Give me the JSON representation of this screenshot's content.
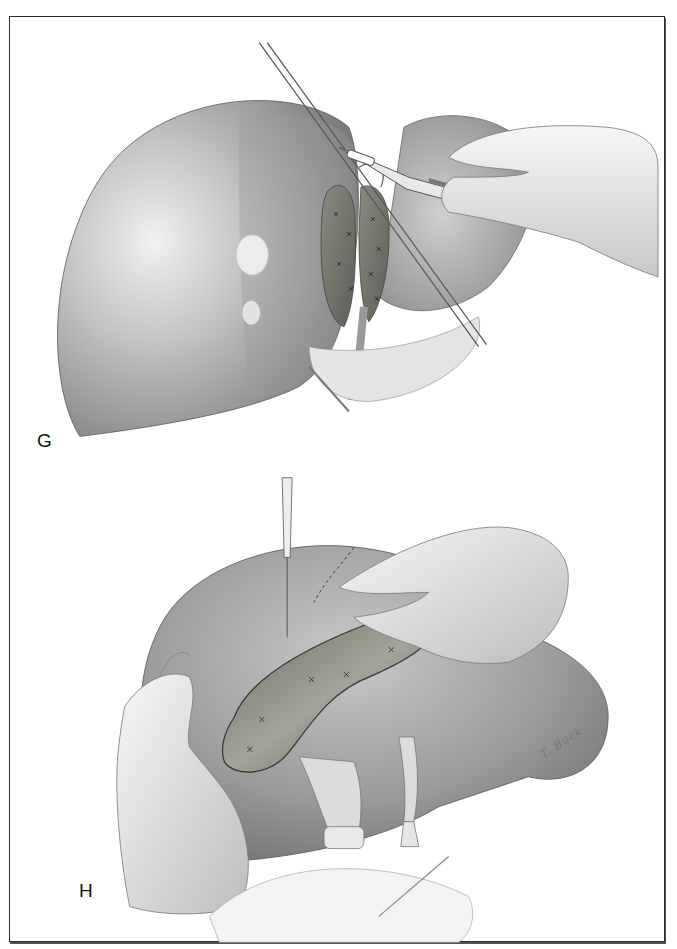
{
  "figure": {
    "type": "surgical-illustration",
    "style": "grayscale medical drawing",
    "panels": [
      {
        "label": "G",
        "description": "Liver with resected segment; suture-ligated parenchymal transection surface, tumor nodules visible on surface, surgeon's hand holding scalpel and forceps over the hilum"
      },
      {
        "label": "H",
        "description": "Liver lobe retracted by two gloved hands; cautery probe dividing parenchyma along dashed line; ligated vessels and hilar structures below"
      }
    ],
    "signature": "T. Buck"
  },
  "colors": {
    "frame": "#2a2a2a",
    "liver_light": "#d8d8d8",
    "liver_mid": "#a6a6a6",
    "liver_dark": "#6e6e6e",
    "cut_surface": "#7a7a72",
    "glove": "#ececec",
    "glove_shadow": "#bdbdbd",
    "label_text": "#111111"
  }
}
